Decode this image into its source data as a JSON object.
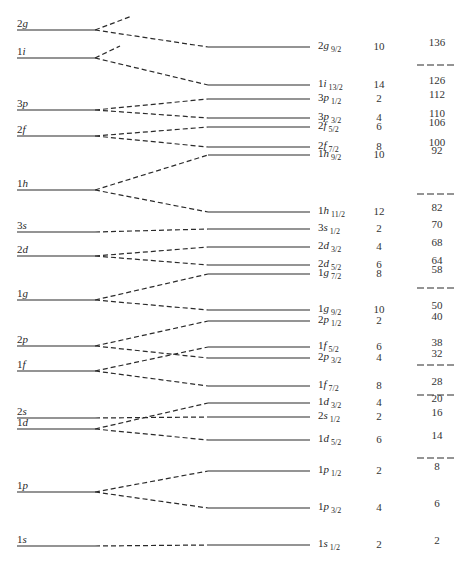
{
  "diagram": {
    "left_levels": [
      {
        "n": "2",
        "l": "g",
        "y": 30
      },
      {
        "n": "1",
        "l": "i",
        "y": 58
      },
      {
        "n": "3",
        "l": "p",
        "y": 110
      },
      {
        "n": "2",
        "l": "f",
        "y": 136
      },
      {
        "n": "1",
        "l": "h",
        "y": 190
      },
      {
        "n": "3",
        "l": "s",
        "y": 232
      },
      {
        "n": "2",
        "l": "d",
        "y": 256
      },
      {
        "n": "1",
        "l": "g",
        "y": 300
      },
      {
        "n": "2",
        "l": "p",
        "y": 346
      },
      {
        "n": "1",
        "l": "f",
        "y": 371
      },
      {
        "n": "2",
        "l": "s",
        "y": 418
      },
      {
        "n": "1",
        "l": "d",
        "y": 429
      },
      {
        "n": "1",
        "l": "p",
        "y": 492
      },
      {
        "n": "1",
        "l": "s",
        "y": 546
      }
    ],
    "right_levels": [
      {
        "n": "2",
        "l": "g",
        "j": "9/2",
        "degeneracy": "10",
        "total": "136",
        "y": 47,
        "from": 0
      },
      {
        "n": "1",
        "l": "i",
        "j": "13/2",
        "degeneracy": "14",
        "total": "126",
        "y": 85,
        "from": 1
      },
      {
        "n": "3",
        "l": "p",
        "j": "1/2",
        "degeneracy": "2",
        "total": "112",
        "y": 99,
        "from": 2
      },
      {
        "n": "3",
        "l": "p",
        "j": "3/2",
        "degeneracy": "4",
        "total": "110",
        "y": 118,
        "from": 2
      },
      {
        "n": "2",
        "l": "f",
        "j": "5/2",
        "degeneracy": "6",
        "total": "106",
        "y": 127,
        "from": 3
      },
      {
        "n": "2",
        "l": "f",
        "j": "7/2",
        "degeneracy": "8",
        "total": "100",
        "y": 147,
        "from": 3
      },
      {
        "n": "1",
        "l": "h",
        "j": "9/2",
        "degeneracy": "10",
        "total": "92",
        "y": 155,
        "from": 4
      },
      {
        "n": "1",
        "l": "h",
        "j": "11/2",
        "degeneracy": "12",
        "total": "82",
        "y": 212,
        "from": 4
      },
      {
        "n": "3",
        "l": "s",
        "j": "1/2",
        "degeneracy": "2",
        "total": "70",
        "y": 229,
        "from": 5
      },
      {
        "n": "2",
        "l": "d",
        "j": "3/2",
        "degeneracy": "4",
        "total": "68",
        "y": 247,
        "from": 6
      },
      {
        "n": "2",
        "l": "d",
        "j": "5/2",
        "degeneracy": "6",
        "total": "64",
        "y": 265,
        "from": 6
      },
      {
        "n": "1",
        "l": "g",
        "j": "7/2",
        "degeneracy": "8",
        "total": "58",
        "y": 274,
        "from": 7
      },
      {
        "n": "1",
        "l": "g",
        "j": "9/2",
        "degeneracy": "10",
        "total": "50",
        "y": 310,
        "from": 7
      },
      {
        "n": "2",
        "l": "p",
        "j": "1/2",
        "degeneracy": "2",
        "total": "40",
        "y": 321,
        "from": 8
      },
      {
        "n": "1",
        "l": "f",
        "j": "5/2",
        "degeneracy": "6",
        "total": "38",
        "y": 347,
        "from": 9
      },
      {
        "n": "2",
        "l": "p",
        "j": "3/2",
        "degeneracy": "4",
        "total": "32",
        "y": 358,
        "from": 8
      },
      {
        "n": "1",
        "l": "f",
        "j": "7/2",
        "degeneracy": "8",
        "total": "28",
        "y": 386,
        "from": 9
      },
      {
        "n": "1",
        "l": "d",
        "j": "3/2",
        "degeneracy": "4",
        "total": "20",
        "y": 403,
        "from": 11
      },
      {
        "n": "2",
        "l": "s",
        "j": "1/2",
        "degeneracy": "2",
        "total": "16",
        "y": 417,
        "from": 10
      },
      {
        "n": "1",
        "l": "d",
        "j": "5/2",
        "degeneracy": "6",
        "total": "14",
        "y": 440,
        "from": 11
      },
      {
        "n": "1",
        "l": "p",
        "j": "1/2",
        "degeneracy": "2",
        "total": "8",
        "y": 471,
        "from": 12
      },
      {
        "n": "1",
        "l": "p",
        "j": "3/2",
        "degeneracy": "4",
        "total": "6",
        "y": 508,
        "from": 12
      },
      {
        "n": "1",
        "l": "s",
        "j": "1/2",
        "degeneracy": "2",
        "total": "2",
        "y": 545,
        "from": 13
      }
    ],
    "upward_stubs": [
      {
        "from": 0,
        "x2": 132,
        "y2": 16
      },
      {
        "from": 1,
        "x2": 120,
        "y2": 46
      }
    ],
    "magic_separators_y": [
      65,
      194,
      288,
      365,
      395,
      458
    ],
    "colors": {
      "line": "#2a2a2a",
      "background": "#ffffff"
    }
  }
}
